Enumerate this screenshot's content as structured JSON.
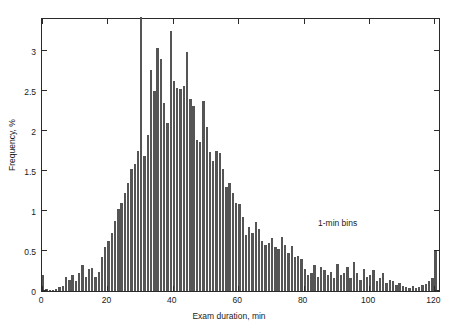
{
  "chart_data": {
    "type": "bar",
    "title": "",
    "subtitle": "",
    "xlabel": "Exam duration, min",
    "ylabel": "Frequency, %",
    "xlim": [
      0,
      122
    ],
    "ylim": [
      0,
      3.42
    ],
    "xticks": [
      0,
      20,
      40,
      60,
      80,
      100,
      120
    ],
    "yticks": [
      0,
      0.5,
      1,
      1.5,
      2,
      2.5,
      3
    ],
    "ytick_labels": [
      "0",
      "0.5",
      "1",
      "1.5",
      "2",
      "2.5",
      "3"
    ],
    "xtick_labels": [
      "0",
      "20",
      "40",
      "60",
      "80",
      "100",
      "120"
    ],
    "grid": false,
    "legend": null,
    "bin_width": 1,
    "bar_color": "#555555",
    "frame_color": "#2b2b2b",
    "annotations": [
      {
        "text": "1-min bins",
        "x": 85,
        "y": 0.95
      }
    ],
    "categories": [
      0,
      1,
      2,
      3,
      4,
      5,
      6,
      7,
      8,
      9,
      10,
      11,
      12,
      13,
      14,
      15,
      16,
      17,
      18,
      19,
      20,
      21,
      22,
      23,
      24,
      25,
      26,
      27,
      28,
      29,
      30,
      31,
      32,
      33,
      34,
      35,
      36,
      37,
      38,
      39,
      40,
      41,
      42,
      43,
      44,
      45,
      46,
      47,
      48,
      49,
      50,
      51,
      52,
      53,
      54,
      55,
      56,
      57,
      58,
      59,
      60,
      61,
      62,
      63,
      64,
      65,
      66,
      67,
      68,
      69,
      70,
      71,
      72,
      73,
      74,
      75,
      76,
      77,
      78,
      79,
      80,
      81,
      82,
      83,
      84,
      85,
      86,
      87,
      88,
      89,
      90,
      91,
      92,
      93,
      94,
      95,
      96,
      97,
      98,
      99,
      100,
      101,
      102,
      103,
      104,
      105,
      106,
      107,
      108,
      109,
      110,
      111,
      112,
      113,
      114,
      115,
      116,
      117,
      118,
      119,
      120
    ],
    "values": [
      0.2,
      0.02,
      0.01,
      0.01,
      0.03,
      0.05,
      0.06,
      0.18,
      0.14,
      0.2,
      0.12,
      0.22,
      0.33,
      0.17,
      0.28,
      0.29,
      0.18,
      0.24,
      0.42,
      0.55,
      0.62,
      0.72,
      0.88,
      1.02,
      1.1,
      1.22,
      1.35,
      1.52,
      1.58,
      1.75,
      3.42,
      1.68,
      1.95,
      2.76,
      2.5,
      3.03,
      2.9,
      2.35,
      2.1,
      3.25,
      2.62,
      2.53,
      2.52,
      2.56,
      2.98,
      2.4,
      2.31,
      1.88,
      1.86,
      2.37,
      2.05,
      1.74,
      1.62,
      1.75,
      1.72,
      1.52,
      1.3,
      1.35,
      1.22,
      1.1,
      1.08,
      0.92,
      0.7,
      0.8,
      0.72,
      0.86,
      0.78,
      0.62,
      0.58,
      0.6,
      0.66,
      0.55,
      0.52,
      0.68,
      0.58,
      0.48,
      0.56,
      0.42,
      0.44,
      0.4,
      0.28,
      0.2,
      0.22,
      0.32,
      0.18,
      0.3,
      0.26,
      0.2,
      0.24,
      0.16,
      0.34,
      0.2,
      0.22,
      0.3,
      0.16,
      0.36,
      0.22,
      0.14,
      0.28,
      0.18,
      0.2,
      0.26,
      0.12,
      0.16,
      0.22,
      0.1,
      0.14,
      0.12,
      0.08,
      0.1,
      0.06,
      0.05,
      0.04,
      0.06,
      0.04,
      0.05,
      0.08,
      0.09,
      0.12,
      0.16,
      0.5
    ]
  }
}
